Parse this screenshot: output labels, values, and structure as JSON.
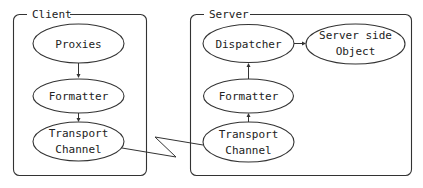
{
  "diagram": {
    "groups": [
      {
        "id": "client",
        "label": "Client"
      },
      {
        "id": "server",
        "label": "Server"
      }
    ],
    "nodes": {
      "client_proxies": {
        "line1": "Proxies",
        "line2": ""
      },
      "client_formatter": {
        "line1": "Formatter",
        "line2": ""
      },
      "client_transport": {
        "line1": "Transport",
        "line2": "Channel"
      },
      "server_dispatcher": {
        "line1": "Dispatcher",
        "line2": ""
      },
      "server_object": {
        "line1": "Server side",
        "line2": "Object"
      },
      "server_formatter": {
        "line1": "Formatter",
        "line2": ""
      },
      "server_transport": {
        "line1": "Transport",
        "line2": "Channel"
      }
    },
    "edges": [
      {
        "from": "Proxies",
        "to": "Formatter",
        "group": "Client",
        "style": "arrow"
      },
      {
        "from": "Formatter",
        "to": "Transport Channel",
        "group": "Client",
        "style": "arrow"
      },
      {
        "from": "Transport Channel (Client)",
        "to": "Transport Channel (Server)",
        "style": "zigzag-network-link"
      },
      {
        "from": "Transport Channel",
        "to": "Formatter",
        "group": "Server",
        "style": "arrow"
      },
      {
        "from": "Formatter",
        "to": "Dispatcher",
        "group": "Server",
        "style": "arrow"
      },
      {
        "from": "Dispatcher",
        "to": "Server side Object",
        "group": "Server",
        "style": "arrow"
      }
    ]
  }
}
